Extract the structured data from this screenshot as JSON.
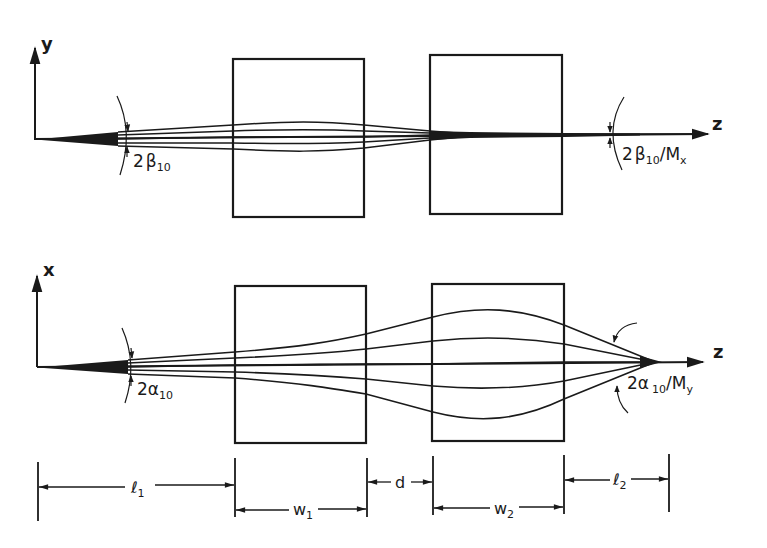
{
  "figure": {
    "colors": {
      "ink": "#1a1a1a",
      "background": "#ffffff"
    },
    "top_panel": {
      "vertical_axis_label": "y",
      "horizontal_axis_label": "z",
      "input_angle": {
        "prefix": "2",
        "symbol": "β",
        "subscript": "10",
        "suffix": ""
      },
      "output_angle": {
        "prefix": "2",
        "symbol": "β",
        "subscript": "10",
        "divider": "/",
        "symbol2": "M",
        "subscript2": "x"
      }
    },
    "bottom_panel": {
      "vertical_axis_label": "x",
      "horizontal_axis_label": "z",
      "input_angle": {
        "prefix": "2",
        "symbol": "α",
        "subscript": "10"
      },
      "output_angle": {
        "prefix": "2",
        "symbol": "α",
        "subscript": "10",
        "divider": "/",
        "symbol2": "M",
        "subscript2": "y"
      }
    },
    "dimensions": {
      "l1": {
        "symbol": "ℓ",
        "subscript": "1"
      },
      "w1": {
        "symbol": "w",
        "subscript": "1"
      },
      "d": {
        "symbol": "d"
      },
      "w2": {
        "symbol": "w",
        "subscript": "2"
      },
      "l2": {
        "symbol": "ℓ",
        "subscript": "2"
      }
    }
  }
}
